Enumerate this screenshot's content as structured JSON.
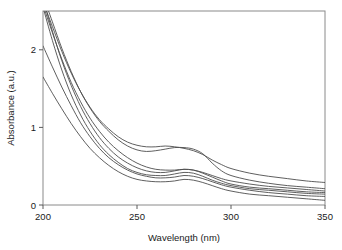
{
  "chart_data": {
    "type": "line",
    "title": "",
    "xlabel": "Wavelength (nm)",
    "ylabel": "Absorbance (a.u.)",
    "xlim": [
      200,
      350
    ],
    "ylim": [
      0,
      2.5
    ],
    "xticks": [
      200,
      250,
      300,
      350
    ],
    "xticklabels": [
      "200",
      "250",
      "300",
      "350"
    ],
    "yticks": [
      0,
      1,
      2
    ],
    "yticklabels": [
      "0",
      "1",
      "2"
    ],
    "grid": false,
    "legend": "none",
    "frame": "box",
    "line_color": "#4d4d4d",
    "line_width": 0.9,
    "x": [
      200,
      205,
      210,
      215,
      220,
      225,
      230,
      235,
      240,
      245,
      250,
      255,
      260,
      265,
      270,
      275,
      280,
      285,
      290,
      295,
      300,
      310,
      320,
      330,
      340,
      350
    ],
    "series": [
      {
        "name": "spectrum-1",
        "values": [
          2.62,
          2.3,
          1.98,
          1.7,
          1.46,
          1.26,
          1.1,
          0.98,
          0.88,
          0.81,
          0.77,
          0.75,
          0.75,
          0.76,
          0.75,
          0.73,
          0.7,
          0.65,
          0.58,
          0.52,
          0.47,
          0.41,
          0.37,
          0.34,
          0.31,
          0.29
        ]
      },
      {
        "name": "spectrum-2",
        "values": [
          2.7,
          2.36,
          2.02,
          1.72,
          1.46,
          1.25,
          1.08,
          0.95,
          0.84,
          0.76,
          0.71,
          0.69,
          0.7,
          0.72,
          0.74,
          0.74,
          0.72,
          0.66,
          0.54,
          0.44,
          0.38,
          0.32,
          0.28,
          0.25,
          0.23,
          0.21
        ]
      },
      {
        "name": "spectrum-3",
        "values": [
          2.58,
          2.22,
          1.88,
          1.58,
          1.33,
          1.12,
          0.95,
          0.81,
          0.7,
          0.61,
          0.54,
          0.49,
          0.46,
          0.45,
          0.45,
          0.46,
          0.45,
          0.42,
          0.38,
          0.34,
          0.31,
          0.27,
          0.24,
          0.22,
          0.2,
          0.18
        ]
      },
      {
        "name": "spectrum-4",
        "values": [
          2.66,
          2.24,
          1.86,
          1.54,
          1.27,
          1.05,
          0.87,
          0.73,
          0.62,
          0.54,
          0.48,
          0.44,
          0.42,
          0.42,
          0.44,
          0.46,
          0.45,
          0.41,
          0.36,
          0.31,
          0.27,
          0.23,
          0.21,
          0.19,
          0.17,
          0.16
        ]
      },
      {
        "name": "spectrum-5",
        "values": [
          2.55,
          2.12,
          1.74,
          1.42,
          1.16,
          0.95,
          0.78,
          0.65,
          0.55,
          0.47,
          0.42,
          0.39,
          0.38,
          0.38,
          0.4,
          0.42,
          0.41,
          0.37,
          0.32,
          0.28,
          0.25,
          0.21,
          0.19,
          0.17,
          0.15,
          0.14
        ]
      },
      {
        "name": "spectrum-6",
        "values": [
          2.05,
          1.78,
          1.52,
          1.28,
          1.06,
          0.88,
          0.73,
          0.61,
          0.52,
          0.45,
          0.4,
          0.37,
          0.35,
          0.35,
          0.36,
          0.38,
          0.37,
          0.34,
          0.3,
          0.26,
          0.23,
          0.19,
          0.16,
          0.14,
          0.12,
          0.11
        ]
      },
      {
        "name": "spectrum-7",
        "values": [
          1.65,
          1.44,
          1.24,
          1.05,
          0.88,
          0.73,
          0.61,
          0.51,
          0.43,
          0.37,
          0.33,
          0.31,
          0.3,
          0.3,
          0.31,
          0.33,
          0.32,
          0.29,
          0.25,
          0.21,
          0.18,
          0.14,
          0.12,
          0.1,
          0.08,
          0.06
        ]
      }
    ]
  }
}
